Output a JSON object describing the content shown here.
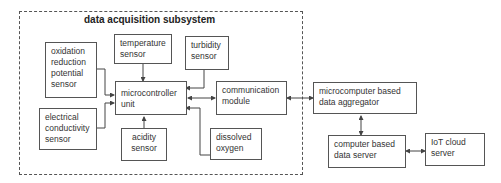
{
  "group": {
    "title": "data acquisition subsystem"
  },
  "nodes": {
    "orp": "oxidation reduction potential sensor",
    "temp": "temperature sensor",
    "turb": "turbidity sensor",
    "mcu": "microcontroller unit",
    "ec": "electrical conductivity sensor",
    "acid": "acidity sensor",
    "do": "dissolved oxygen",
    "comm": "communication module",
    "agg": "microcomputer based data aggregator",
    "server": "computer based data server",
    "cloud": "IoT cloud server"
  }
}
